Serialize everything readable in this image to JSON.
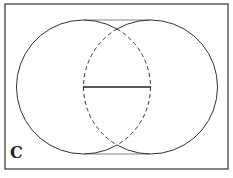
{
  "figure": {
    "label": "C",
    "colors": {
      "stroke": "#333333",
      "background": "#ffffff"
    },
    "circles": [
      {
        "name": "left-circle",
        "cx": 84,
        "cy": 87,
        "r": 67
      },
      {
        "name": "right-circle",
        "cx": 150,
        "cy": 87,
        "r": 67
      }
    ],
    "segment": {
      "x1": 83,
      "y1": 87,
      "x2": 151,
      "y2": 87
    }
  }
}
